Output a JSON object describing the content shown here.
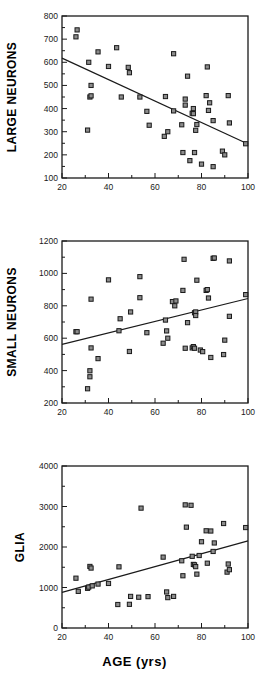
{
  "figure": {
    "xlabel": "AGE  (yrs)",
    "background": "#ffffff",
    "marker_fill": "#8c8c8c",
    "marker_stroke": "#1a1a1a",
    "line_color": "#1a1a1a"
  },
  "chart_data": [
    {
      "type": "scatter",
      "title": "",
      "ylabel": "LARGE NEURONS",
      "xlabel": "AGE  (yrs)",
      "xlim": [
        20,
        100
      ],
      "ylim": [
        100,
        800
      ],
      "xticks": [
        20,
        40,
        60,
        80,
        100
      ],
      "yticks": [
        100,
        200,
        300,
        400,
        500,
        600,
        700,
        800
      ],
      "xtick_labels": [
        "20",
        "40",
        "60",
        "80",
        "100"
      ],
      "ytick_labels": [
        "100",
        "200",
        "300",
        "400",
        "500",
        "600",
        "700",
        "800"
      ],
      "grid": false,
      "legend": "none",
      "points": [
        [
          26,
          710
        ],
        [
          26.5,
          740
        ],
        [
          31,
          307
        ],
        [
          31.5,
          600
        ],
        [
          32,
          450
        ],
        [
          32.5,
          455
        ],
        [
          32.5,
          500
        ],
        [
          35.5,
          645
        ],
        [
          40,
          582
        ],
        [
          43.5,
          663
        ],
        [
          45.5,
          450
        ],
        [
          48.5,
          578
        ],
        [
          49,
          555
        ],
        [
          53.5,
          450
        ],
        [
          56.5,
          388
        ],
        [
          57.5,
          328
        ],
        [
          64,
          280
        ],
        [
          64.5,
          452
        ],
        [
          65.5,
          300
        ],
        [
          68,
          637
        ],
        [
          68,
          390
        ],
        [
          71.5,
          330
        ],
        [
          72,
          210
        ],
        [
          73,
          441
        ],
        [
          73,
          415
        ],
        [
          74,
          540
        ],
        [
          75,
          175
        ],
        [
          76,
          380
        ],
        [
          76.5,
          400
        ],
        [
          76.5,
          378
        ],
        [
          77,
          210
        ],
        [
          77.5,
          306
        ],
        [
          78,
          331
        ],
        [
          80,
          160
        ],
        [
          82,
          456
        ],
        [
          82.5,
          580
        ],
        [
          83,
          392
        ],
        [
          83.5,
          425
        ],
        [
          85,
          149
        ],
        [
          85,
          348
        ],
        [
          89,
          216
        ],
        [
          90,
          200
        ],
        [
          91.5,
          456
        ],
        [
          92,
          338
        ],
        [
          99,
          248
        ]
      ],
      "fit_line": {
        "x": [
          20,
          100
        ],
        "y": [
          618,
          247
        ]
      }
    },
    {
      "type": "scatter",
      "title": "",
      "ylabel": "SMALL NEURONS",
      "xlabel": "AGE  (yrs)",
      "xlim": [
        20,
        100
      ],
      "ylim": [
        200,
        1200
      ],
      "xticks": [
        20,
        40,
        60,
        80,
        100
      ],
      "yticks": [
        200,
        400,
        600,
        800,
        1000,
        1200
      ],
      "xtick_labels": [
        "20",
        "40",
        "60",
        "80",
        "100"
      ],
      "ytick_labels": [
        "200",
        "400",
        "600",
        "800",
        "1000",
        "1200"
      ],
      "grid": false,
      "legend": "none",
      "points": [
        [
          26,
          640
        ],
        [
          26.5,
          640
        ],
        [
          31,
          288
        ],
        [
          32,
          399
        ],
        [
          32,
          362
        ],
        [
          32.5,
          540
        ],
        [
          32.5,
          841
        ],
        [
          35.5,
          474
        ],
        [
          40,
          960
        ],
        [
          44.5,
          646
        ],
        [
          45,
          720
        ],
        [
          49,
          518
        ],
        [
          49.5,
          762
        ],
        [
          53.5,
          980
        ],
        [
          53.5,
          850
        ],
        [
          56.5,
          634
        ],
        [
          63.5,
          569
        ],
        [
          64.5,
          712
        ],
        [
          65,
          645
        ],
        [
          65.5,
          600
        ],
        [
          67.5,
          826
        ],
        [
          68.5,
          800
        ],
        [
          69,
          830
        ],
        [
          72,
          895
        ],
        [
          72.5,
          1087
        ],
        [
          73,
          538
        ],
        [
          74,
          696
        ],
        [
          76,
          540
        ],
        [
          76.5,
          548
        ],
        [
          77,
          538
        ],
        [
          77,
          757
        ],
        [
          77.5,
          762
        ],
        [
          77.5,
          740
        ],
        [
          78,
          958
        ],
        [
          79.5,
          527
        ],
        [
          80.5,
          517
        ],
        [
          82,
          895
        ],
        [
          82.5,
          900
        ],
        [
          83,
          848
        ],
        [
          84,
          481
        ],
        [
          85,
          1093
        ],
        [
          85.5,
          1095
        ],
        [
          89.5,
          499
        ],
        [
          90,
          588
        ],
        [
          92,
          735
        ],
        [
          92,
          1077
        ],
        [
          99,
          869
        ]
      ],
      "fit_line": {
        "x": [
          20,
          100
        ],
        "y": [
          562,
          845
        ]
      }
    },
    {
      "type": "scatter",
      "title": "",
      "ylabel": "GLIA",
      "xlabel": "AGE  (yrs)",
      "xlim": [
        20,
        100
      ],
      "ylim": [
        0,
        4000
      ],
      "xticks": [
        20,
        40,
        60,
        80,
        100
      ],
      "yticks": [
        0,
        1000,
        2000,
        3000,
        4000
      ],
      "xtick_labels": [
        "20",
        "40",
        "60",
        "80",
        "100"
      ],
      "ytick_labels": [
        "0",
        "1000",
        "2000",
        "3000",
        "4000"
      ],
      "grid": false,
      "legend": "none",
      "points": [
        [
          26,
          1230
        ],
        [
          27,
          905
        ],
        [
          31,
          980
        ],
        [
          31.5,
          1010
        ],
        [
          32,
          1520
        ],
        [
          32.5,
          1480
        ],
        [
          33,
          1040
        ],
        [
          35.5,
          1085
        ],
        [
          40,
          1100
        ],
        [
          44,
          580
        ],
        [
          44.5,
          1510
        ],
        [
          49,
          585
        ],
        [
          49.5,
          780
        ],
        [
          53,
          760
        ],
        [
          54,
          2960
        ],
        [
          57,
          775
        ],
        [
          63.5,
          1750
        ],
        [
          65,
          890
        ],
        [
          65.5,
          750
        ],
        [
          68,
          780
        ],
        [
          71.5,
          1660
        ],
        [
          72,
          1290
        ],
        [
          73,
          3040
        ],
        [
          73.5,
          2490
        ],
        [
          75.5,
          3030
        ],
        [
          76,
          1770
        ],
        [
          76.5,
          1570
        ],
        [
          77,
          1560
        ],
        [
          77.5,
          1515
        ],
        [
          78,
          1330
        ],
        [
          79,
          1790
        ],
        [
          80,
          2130
        ],
        [
          82,
          2400
        ],
        [
          82.5,
          1600
        ],
        [
          84,
          2395
        ],
        [
          85,
          1890
        ],
        [
          85.5,
          2100
        ],
        [
          89.5,
          2580
        ],
        [
          91,
          1380
        ],
        [
          91.5,
          1580
        ],
        [
          92,
          1440
        ],
        [
          99,
          2480
        ]
      ],
      "fit_line": {
        "x": [
          20,
          100
        ],
        "y": [
          880,
          2150
        ]
      }
    }
  ]
}
